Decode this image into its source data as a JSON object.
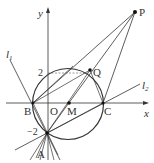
{
  "figure": {
    "axes": {
      "x_label": "x",
      "y_label": "y",
      "origin_label": "O"
    },
    "ticks": {
      "y_pos": "2",
      "y_neg": "−2"
    },
    "points": {
      "P": "P",
      "Q": "Q",
      "B": "B",
      "M": "M",
      "C": "C",
      "A": "A"
    },
    "lines": {
      "l1": "l",
      "l1_sub": "1",
      "l2": "l",
      "l2_sub": "2"
    },
    "colors": {
      "stroke": "#333333",
      "dashed": "#777777",
      "background": "#ffffff"
    }
  }
}
